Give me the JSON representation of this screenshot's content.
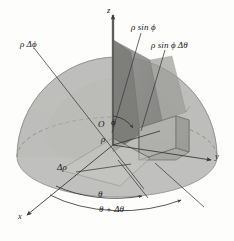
{
  "figure": {
    "name": "spherical-coordinates-volume-element",
    "colors": {
      "background": "#fdfdfc",
      "sphere_light": "#c9c9c7",
      "sphere_mid": "#b9b9b6",
      "sphere_dark": "#a6a6a3",
      "wedge_dark": "#8b8b88",
      "wedge_mid": "#9d9d9a",
      "box_face": "#b2b2ae",
      "line": "#3a3a3a",
      "text": "#1a1a1a"
    }
  },
  "axes": {
    "z": "z",
    "y": "y",
    "x": "x",
    "origin": "O"
  },
  "labels": {
    "rho_delta_phi": "ρ Δϕ",
    "rho_sin_phi": "ρ sin ϕ",
    "rho_sin_phi_delta_theta": "ρ sin ϕ Δθ",
    "phi": "ϕ",
    "rho": "ρ",
    "delta_rho": "Δρ",
    "theta": "θ",
    "theta_plus_delta_theta": "θ + Δθ"
  }
}
